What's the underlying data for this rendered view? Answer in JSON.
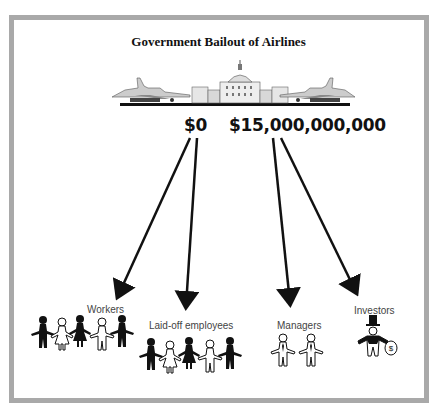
{
  "title": "Government Bailout of Airlines",
  "amounts": {
    "left": "$0",
    "right": "$15,000,000,000"
  },
  "recipients": [
    {
      "label": "Workers",
      "source": "$0"
    },
    {
      "label": "Laid-off employees",
      "source": "$0"
    },
    {
      "label": "Managers",
      "source": "$15,000,000,000"
    },
    {
      "label": "Investors",
      "source": "$15,000,000,000"
    }
  ],
  "icons": {
    "illustration": [
      "airplane-left",
      "capitol-building",
      "airplane-right"
    ],
    "money_bag_symbol": "$"
  },
  "colors": {
    "frame": "#a9a9a9",
    "ink": "#111111"
  }
}
